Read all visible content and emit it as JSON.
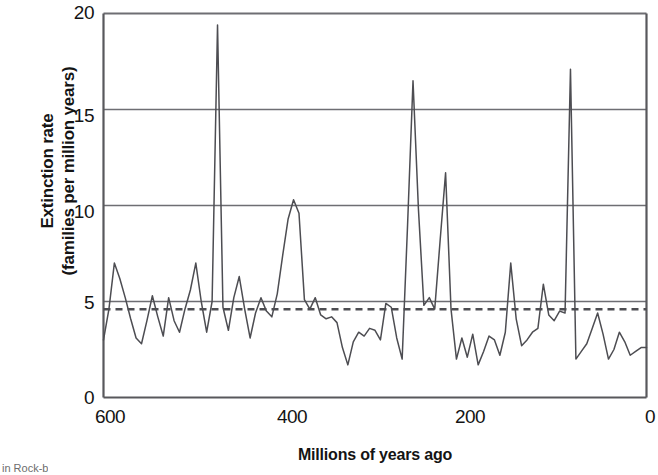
{
  "figure": {
    "caption_fragment": "in Rock-b"
  },
  "chart_data": {
    "type": "line",
    "title": "",
    "xlabel": "Millions of years ago",
    "ylabel": "Extinction rate\n(families per million years)",
    "ylabel_line1": "Extinction rate",
    "ylabel_line2": "(families per million years)",
    "xlim": [
      600,
      0
    ],
    "ylim": [
      0,
      20
    ],
    "x_reversed": true,
    "grid": "horizontal",
    "legend": "none",
    "xticks": [
      600,
      400,
      200,
      0
    ],
    "xtick_labels": [
      "600",
      "400",
      "200",
      "0"
    ],
    "yticks": [
      0,
      5,
      10,
      15,
      20
    ],
    "ytick_labels": [
      "0",
      "5",
      "10",
      "15",
      "20"
    ],
    "line_color": "#4d4d52",
    "gridline_color": "#6e6e73",
    "axis_color": "#58585c",
    "series": [
      {
        "name": "Extinction rate",
        "style": "solid",
        "x": [
          600,
          594,
          588,
          582,
          576,
          570,
          564,
          558,
          552,
          546,
          540,
          534,
          528,
          522,
          516,
          510,
          504,
          498,
          492,
          486,
          480,
          474,
          468,
          462,
          456,
          450,
          444,
          438,
          432,
          426,
          420,
          414,
          408,
          402,
          396,
          390,
          384,
          378,
          372,
          366,
          360,
          354,
          348,
          342,
          336,
          330,
          324,
          318,
          312,
          306,
          300,
          294,
          288,
          282,
          276,
          270,
          264,
          258,
          252,
          246,
          240,
          234,
          228,
          222,
          216,
          210,
          204,
          198,
          192,
          186,
          180,
          174,
          168,
          162,
          156,
          150,
          144,
          138,
          132,
          126,
          120,
          114,
          108,
          102,
          96,
          90,
          84,
          78,
          72,
          66,
          60,
          54,
          48,
          42,
          36,
          30,
          24,
          18,
          12,
          6,
          0
        ],
        "y": [
          3.0,
          4.6,
          7.0,
          6.2,
          5.2,
          4.1,
          3.1,
          2.8,
          4.0,
          5.3,
          4.2,
          3.2,
          5.2,
          4.0,
          3.4,
          4.6,
          5.6,
          7.0,
          5.0,
          3.4,
          5.0,
          19.4,
          4.7,
          3.5,
          5.2,
          6.3,
          4.6,
          3.1,
          4.4,
          5.2,
          4.5,
          4.2,
          5.4,
          7.4,
          9.3,
          10.3,
          9.6,
          5.1,
          4.6,
          5.2,
          4.3,
          4.1,
          4.2,
          3.9,
          2.6,
          1.7,
          2.9,
          3.4,
          3.2,
          3.6,
          3.5,
          3.0,
          4.9,
          4.7,
          3.1,
          2.0,
          9.0,
          16.5,
          9.8,
          4.8,
          5.2,
          4.6,
          8.2,
          11.7,
          4.6,
          2.0,
          3.1,
          2.1,
          3.3,
          1.7,
          2.4,
          3.2,
          3.0,
          2.2,
          3.4,
          7.0,
          4.1,
          2.7,
          3.0,
          3.4,
          3.6,
          5.9,
          4.3,
          4.0,
          4.5,
          4.4,
          17.1,
          2.0,
          2.4,
          2.8,
          3.6,
          4.4,
          3.3,
          2.0,
          2.5,
          3.4,
          2.9,
          2.2,
          2.4,
          2.6,
          2.6
        ]
      },
      {
        "name": "Mean background rate",
        "style": "dashed",
        "value": 4.6
      }
    ]
  }
}
